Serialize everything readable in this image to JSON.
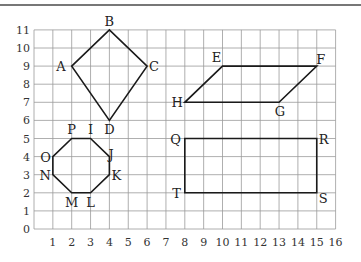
{
  "chart_data": {
    "type": "diagram",
    "title": "",
    "grid": {
      "x_range": [
        0,
        16
      ],
      "y_range": [
        0,
        11
      ],
      "gridlines": true
    },
    "x_ticks": [
      "1",
      "2",
      "3",
      "4",
      "5",
      "6",
      "7",
      "8",
      "9",
      "10",
      "11",
      "12",
      "13",
      "14",
      "15",
      "16"
    ],
    "y_ticks": [
      "0",
      "1",
      "2",
      "3",
      "4",
      "5",
      "6",
      "7",
      "8",
      "9",
      "10",
      "11"
    ],
    "shapes": [
      {
        "name": "kite",
        "points": [
          {
            "label": "A",
            "x": 2,
            "y": 9
          },
          {
            "label": "B",
            "x": 4,
            "y": 11
          },
          {
            "label": "C",
            "x": 6,
            "y": 9
          },
          {
            "label": "D",
            "x": 4,
            "y": 6
          }
        ]
      },
      {
        "name": "parallelogram",
        "points": [
          {
            "label": "E",
            "x": 10,
            "y": 9
          },
          {
            "label": "F",
            "x": 15,
            "y": 9
          },
          {
            "label": "G",
            "x": 13,
            "y": 7
          },
          {
            "label": "H",
            "x": 8,
            "y": 7
          }
        ]
      },
      {
        "name": "octagon",
        "points": [
          {
            "label": "P",
            "x": 2,
            "y": 5
          },
          {
            "label": "I",
            "x": 3,
            "y": 5
          },
          {
            "label": "J",
            "x": 4,
            "y": 4
          },
          {
            "label": "K",
            "x": 4,
            "y": 3
          },
          {
            "label": "L",
            "x": 3,
            "y": 2
          },
          {
            "label": "M",
            "x": 2,
            "y": 2
          },
          {
            "label": "N",
            "x": 1,
            "y": 3
          },
          {
            "label": "O",
            "x": 1,
            "y": 4
          }
        ]
      },
      {
        "name": "rectangle",
        "points": [
          {
            "label": "Q",
            "x": 8,
            "y": 5
          },
          {
            "label": "R",
            "x": 15,
            "y": 5
          },
          {
            "label": "S",
            "x": 15,
            "y": 2
          },
          {
            "label": "T",
            "x": 8,
            "y": 2
          }
        ]
      }
    ]
  },
  "labels": {
    "A": "A",
    "B": "B",
    "C": "C",
    "D": "D",
    "E": "E",
    "F": "F",
    "G": "G",
    "H": "H",
    "I": "I",
    "J": "J",
    "K": "K",
    "L": "L",
    "M": "M",
    "N": "N",
    "O": "O",
    "P": "P",
    "Q": "Q",
    "R": "R",
    "S": "S",
    "T": "T"
  },
  "colors": {
    "grid": "#9a9a9a",
    "shape": "#1a1a1a",
    "text": "#222222"
  }
}
